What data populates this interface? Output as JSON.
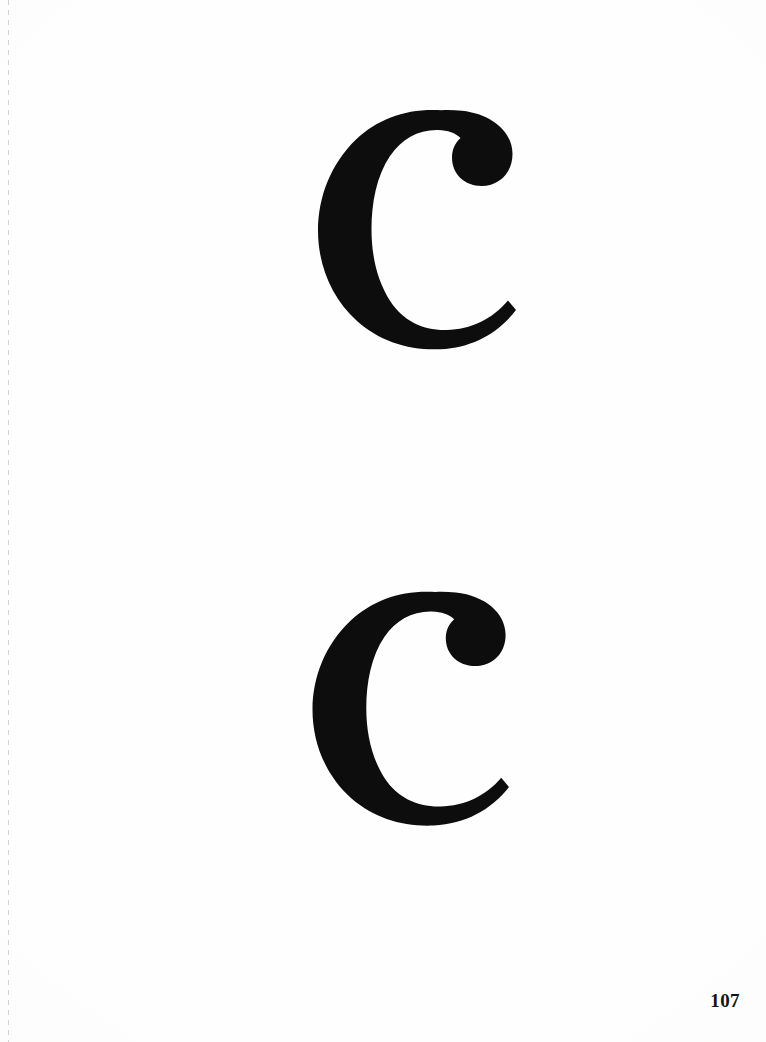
{
  "page": {
    "width": 766,
    "height": 1042,
    "background_color": "#fefefe",
    "ink_color": "#0d0d0d",
    "page_number": "107",
    "page_number_position": "bottom-right"
  },
  "binding_guide": {
    "name": "dashed-trim-guide",
    "orientation": "vertical",
    "x": 8,
    "color": "#969696",
    "style": "dashed"
  },
  "specimens": [
    {
      "character": "c",
      "case": "lowercase",
      "style": "bold-didone-serif",
      "terminal": "ball-terminal-top-right",
      "x": 312,
      "y": 106,
      "width": 208,
      "height": 248,
      "label": "c"
    },
    {
      "character": "c",
      "case": "lowercase",
      "style": "bold-didone-serif",
      "terminal": "ball-terminal-top-right",
      "x": 306,
      "y": 588,
      "width": 208,
      "height": 242,
      "label": "c"
    }
  ]
}
